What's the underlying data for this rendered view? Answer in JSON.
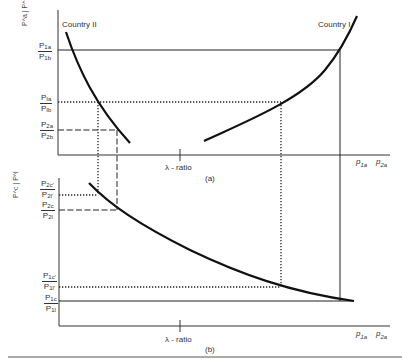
{
  "panel_a": {
    "caption": "(a)",
    "y_axis_label": "P^a | P^b",
    "x_axis_label": "λ - ratio",
    "x_right_labels": [
      "p1a",
      "p2a"
    ],
    "curve_labels": {
      "left": "Country II",
      "right": "Country I"
    },
    "y_ticks": [
      {
        "num": "P",
        "num_sub": "1a",
        "den": "P",
        "den_sub": "1b"
      },
      {
        "num": "P",
        "num_sub": "Ia",
        "den": "P",
        "den_sub": "Ib"
      },
      {
        "num": "P",
        "num_sub": "2a",
        "den": "P",
        "den_sub": "2b"
      }
    ]
  },
  "panel_b": {
    "caption": "(b)",
    "y_axis_label": "P^c | P^l",
    "x_axis_label": "λ - ratio",
    "x_right_labels": [
      "p1a",
      "p2a"
    ],
    "y_ticks": [
      {
        "num": "P",
        "num_sub": "2c'",
        "den": "P",
        "den_sub": "2l'"
      },
      {
        "num": "P",
        "num_sub": "2c",
        "den": "P",
        "den_sub": "2l"
      },
      {
        "num": "P",
        "num_sub": "1c'",
        "den": "P",
        "den_sub": "1l'"
      },
      {
        "num": "P",
        "num_sub": "1c",
        "den": "P",
        "den_sub": "1l"
      }
    ]
  },
  "line_styles": {
    "solid": "price-ratio level 1 (P1a/P1b, P1c/P1l)",
    "dotted": "intermediate price-ratio (PIa/PIb, P1c'/P1l', P2c'/P2l')",
    "dashed": "price-ratio level 2 (P2a/P2b, P2c/P2l)"
  },
  "colors": {
    "ink": "#1a1a1a",
    "paper": "#ffffff"
  }
}
